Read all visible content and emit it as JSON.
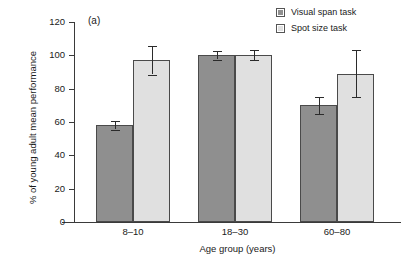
{
  "chart_data": {
    "type": "bar",
    "title": "",
    "panel_label": "(a)",
    "categories": [
      "8–10",
      "18–30",
      "60–80"
    ],
    "series": [
      {
        "name": "Visual span task",
        "color": "#8f8f8f",
        "values": [
          58,
          100,
          70
        ],
        "errors": [
          2.5,
          2.5,
          5
        ]
      },
      {
        "name": "Spot size task",
        "color": "#e0e0e0",
        "values": [
          97,
          100,
          89
        ],
        "errors": [
          8.5,
          3,
          14
        ]
      }
    ],
    "xlabel": "Age group (years)",
    "ylabel": "% of young adult mean performance",
    "ylim": [
      0,
      120
    ],
    "yticks": [
      0,
      20,
      40,
      60,
      80,
      100,
      120
    ],
    "ytick_labels": [
      "0",
      "20",
      "40",
      "60",
      "80",
      "100",
      "120"
    ],
    "grid": false,
    "legend_position": "top-right",
    "error_bar_style": "symmetric-capped"
  },
  "legend": {
    "entries": [
      {
        "label": "Visual span task",
        "swatch_icon": "legend-swatch-dark"
      },
      {
        "label": "Spot size task",
        "swatch_icon": "legend-swatch-light"
      }
    ]
  }
}
